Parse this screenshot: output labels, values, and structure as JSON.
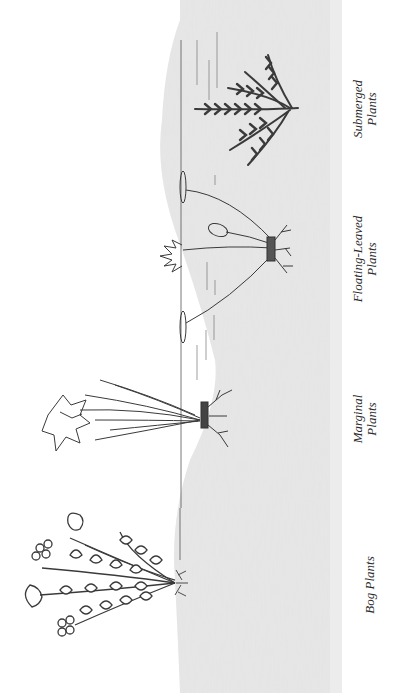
{
  "diagram": {
    "orientation": "rotated 90° counter-clockwise",
    "colors": {
      "ink": "#3a3a3a",
      "ground_shade": "#e6e6e6",
      "background": "#ffffff"
    },
    "zones": [
      {
        "id": "bog",
        "label_line1": "Bog Plants",
        "label_line2": ""
      },
      {
        "id": "marginal",
        "label_line1": "Marginal",
        "label_line2": "Plants"
      },
      {
        "id": "floating",
        "label_line1": "Floating-Leaved",
        "label_line2": "Plants"
      },
      {
        "id": "submerged",
        "label_line1": "Submerged",
        "label_line2": "Plants"
      }
    ]
  }
}
